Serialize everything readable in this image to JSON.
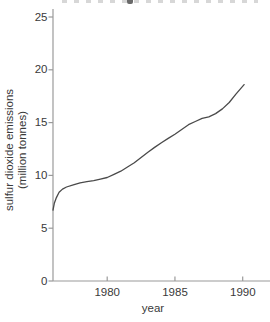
{
  "chart_data": {
    "type": "line",
    "xlabel": "year",
    "ylabel_lines": [
      "sulfur dioxide emissions",
      "(million tonnes)"
    ],
    "x_ticks": [
      "1980",
      "1985",
      "1990"
    ],
    "y_ticks": [
      "0",
      "5",
      "10",
      "15",
      "20",
      "25"
    ],
    "xlim": [
      1976,
      1992
    ],
    "ylim": [
      0,
      25.8
    ],
    "grid": false,
    "legend": "none",
    "title_clipped_at_top": true,
    "series": [
      {
        "name": "sulfur dioxide emissions",
        "x": [
          1976.0,
          1976.1,
          1976.25,
          1976.45,
          1976.7,
          1977.0,
          1977.5,
          1978.0,
          1978.5,
          1979.0,
          1979.5,
          1980.0,
          1980.5,
          1981.0,
          1981.5,
          1982.0,
          1982.5,
          1983.0,
          1983.5,
          1984.0,
          1984.5,
          1985.0,
          1985.5,
          1986.0,
          1986.5,
          1987.0,
          1987.5,
          1988.0,
          1988.5,
          1989.0,
          1989.5,
          1990.1
        ],
        "y": [
          6.7,
          7.4,
          7.9,
          8.4,
          8.7,
          8.9,
          9.1,
          9.3,
          9.4,
          9.5,
          9.65,
          9.8,
          10.1,
          10.4,
          10.8,
          11.2,
          11.7,
          12.2,
          12.65,
          13.1,
          13.5,
          13.9,
          14.35,
          14.8,
          15.1,
          15.4,
          15.55,
          15.85,
          16.3,
          16.9,
          17.7,
          18.6
        ]
      }
    ],
    "colors": {
      "line": "#4a4a4a",
      "axis": "#9a9a9a",
      "text": "#3a3a3a",
      "background": "#ffffff"
    }
  }
}
